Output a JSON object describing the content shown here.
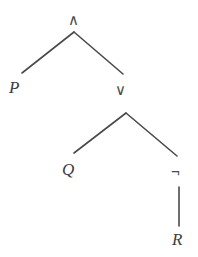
{
  "diagram": {
    "background_color": "#ffffff",
    "edge_color": "#4a4a4a",
    "label_color": "#3d3d3d",
    "nodes": [
      {
        "id": "root",
        "label": "∧",
        "kind": "operator",
        "name": "conjunction",
        "x": 74,
        "y": 20
      },
      {
        "id": "p",
        "label": "P",
        "kind": "atom",
        "name": "proposition-p",
        "x": 14,
        "y": 88
      },
      {
        "id": "or",
        "label": "∨",
        "kind": "operator",
        "name": "disjunction",
        "x": 121,
        "y": 90
      },
      {
        "id": "q",
        "label": "Q",
        "kind": "atom",
        "name": "proposition-q",
        "x": 68,
        "y": 170
      },
      {
        "id": "not",
        "label": "¬",
        "kind": "operator",
        "name": "negation",
        "x": 178,
        "y": 172
      },
      {
        "id": "r",
        "label": "R",
        "kind": "atom",
        "name": "proposition-r",
        "x": 180,
        "y": 240
      }
    ],
    "edges": [
      {
        "from": "root",
        "to": "p",
        "x1": 74,
        "y1": 32,
        "x2": 22,
        "y2": 73
      },
      {
        "from": "root",
        "to": "or",
        "x1": 74,
        "y1": 32,
        "x2": 123,
        "y2": 74
      },
      {
        "from": "or",
        "to": "q",
        "x1": 126,
        "y1": 113,
        "x2": 74,
        "y2": 153
      },
      {
        "from": "or",
        "to": "not",
        "x1": 126,
        "y1": 113,
        "x2": 177,
        "y2": 156
      },
      {
        "from": "not",
        "to": "r",
        "x1": 179,
        "y1": 187,
        "x2": 179,
        "y2": 226
      }
    ]
  }
}
